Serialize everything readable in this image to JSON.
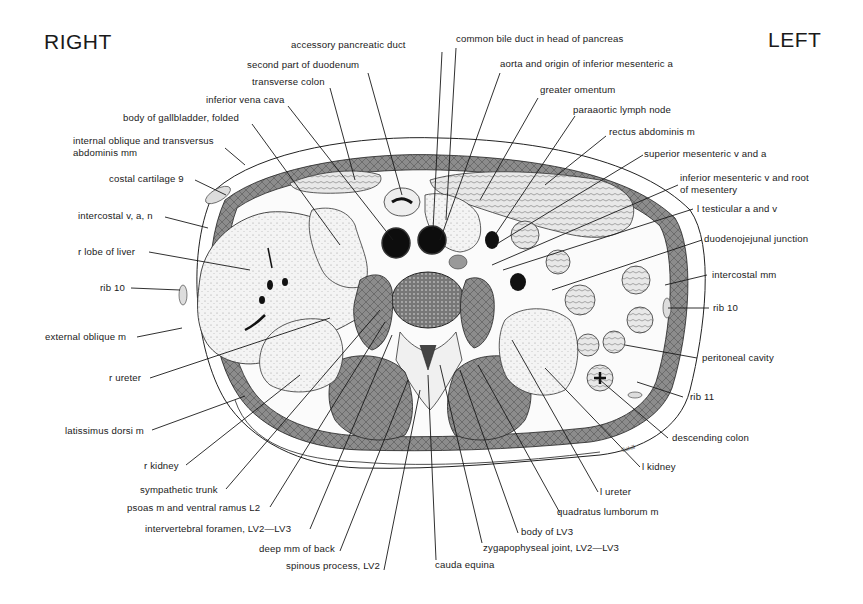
{
  "orientation": {
    "right": "RIGHT",
    "left": "LEFT"
  },
  "signature": "Cahill",
  "labels": {
    "accessory_pancreatic_duct": "accessory pancreatic duct",
    "common_bile_duct": "common bile duct in head of pancreas",
    "second_part_duodenum": "second part of duodenum",
    "aorta": "aorta and origin of inferior mesenteric a",
    "transverse_colon": "transverse colon",
    "greater_omentum": "greater omentum",
    "inferior_vena_cava": "inferior vena cava",
    "paraaortic_lymph_node": "paraaortic lymph node",
    "body_gallbladder": "body of gallbladder, folded",
    "rectus_abdominis": "rectus abdominis m",
    "internal_oblique_1": "internal oblique and transversus",
    "internal_oblique_2": "abdominis mm",
    "superior_mesenteric": "superior mesenteric v and a",
    "costal_cartilage": "costal cartilage 9",
    "inferior_mesenteric_1": "inferior mesenteric v and root",
    "inferior_mesenteric_2": "of mesentery",
    "intercostal_van": "intercostal v, a, n",
    "l_testicular": "l testicular a and v",
    "r_lobe_liver": "r lobe of liver",
    "duodenojejunal": "duodenojejunal junction",
    "rib10_right": "rib 10",
    "intercostal_mm": "intercostal mm",
    "rib10_left": "rib 10",
    "external_oblique": "external oblique m",
    "peritoneal_cavity": "peritoneal cavity",
    "r_ureter": "r ureter",
    "rib11": "rib 11",
    "latissimus_dorsi": "latissimus dorsi m",
    "descending_colon": "descending colon",
    "r_kidney": "r kidney",
    "l_kidney": "l kidney",
    "sympathetic_trunk": "sympathetic trunk",
    "l_ureter": "l ureter",
    "psoas": "psoas m and ventral ramus L2",
    "quadratus_lumborum": "quadratus lumborum m",
    "intervertebral_foramen": "intervertebral foramen, LV2—LV3",
    "body_lv3": "body of LV3",
    "deep_mm_back": "deep mm of back",
    "zygapophyseal_joint": "zygapophyseal joint, LV2—LV3",
    "spinous_process": "spinous process, LV2",
    "cauda_equina": "cauda equina"
  },
  "colors": {
    "ink": "#1a1a1a",
    "muscle": "#8a8a8a",
    "liver": "#eeeeee",
    "vessel": "#111111",
    "paper": "#ffffff"
  }
}
